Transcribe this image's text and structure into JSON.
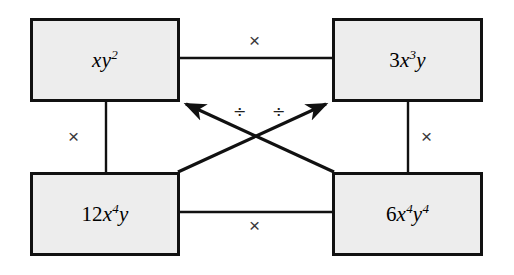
{
  "diagram": {
    "type": "factor-box-diagram",
    "background_color": "#ffffff",
    "box_fill_color": "#ededed",
    "box_border_color": "#111111",
    "line_color": "#111111",
    "nodes": [
      {
        "id": "top-left",
        "expression": "xy",
        "coefficient": "",
        "base": "xy",
        "exponent": "2",
        "full_text": "xy^2"
      },
      {
        "id": "top-right",
        "expression": "3x^3y",
        "coefficient": "3",
        "base": "x",
        "exponent": "3",
        "full_text": "3x^3y"
      },
      {
        "id": "bottom-left",
        "expression": "12x^4y",
        "coefficient": "12",
        "base": "x",
        "exponent": "4",
        "full_text": "12x^4y"
      },
      {
        "id": "bottom-right",
        "expression": "6x^4y^4",
        "coefficient": "6",
        "base": "x",
        "exponent": "4",
        "full_text": "6x^4y^4"
      }
    ],
    "node_labels": {
      "top_left": {
        "coef": "",
        "var1": "xy",
        "sup1": "2",
        "var2": "",
        "sup2": ""
      },
      "top_right": {
        "coef": "3",
        "var1": "x",
        "sup1": "3",
        "var2": "y",
        "sup2": ""
      },
      "bottom_left": {
        "coef": "12",
        "var1": "x",
        "sup1": "4",
        "var2": "y",
        "sup2": ""
      },
      "bottom_right": {
        "coef": "6",
        "var1": "x",
        "sup1": "4",
        "var2": "y",
        "sup2": "4"
      }
    },
    "operators": {
      "top": "×",
      "left": "×",
      "right": "×",
      "bottom": "×",
      "diagonal_left": "÷",
      "diagonal_right": "÷"
    },
    "connections": [
      {
        "from": "top-left",
        "to": "top-right",
        "operator": "×",
        "style": "line"
      },
      {
        "from": "top-left",
        "to": "bottom-left",
        "operator": "×",
        "style": "line"
      },
      {
        "from": "top-right",
        "to": "bottom-right",
        "operator": "×",
        "style": "line"
      },
      {
        "from": "bottom-left",
        "to": "bottom-right",
        "operator": "×",
        "style": "line"
      },
      {
        "from": "bottom-right",
        "to": "top-left",
        "operator": "÷",
        "style": "arrow"
      },
      {
        "from": "bottom-left",
        "to": "top-right",
        "operator": "÷",
        "style": "arrow"
      }
    ]
  }
}
